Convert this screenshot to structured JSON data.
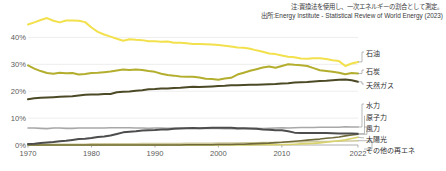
{
  "note": {
    "line1": "注:置換法を使用し、一次エネルギーの割合として測定。",
    "line2": "出所:Energy Institute - Statistical Review of World Energy (2023)"
  },
  "axis": {
    "y_ticks": [
      "0%",
      "10%",
      "20%",
      "30%",
      "40%"
    ],
    "x_ticks": [
      "1970",
      "1980",
      "1990",
      "2000",
      "2010",
      "2022"
    ]
  },
  "legend": {
    "oil": "石油",
    "coal": "石炭",
    "gas": "天然ガス",
    "hydro": "水力",
    "nuclear": "原子力",
    "wind": "風力",
    "solar": "太陽光",
    "other_renew": "その他の再エネ"
  },
  "colors": {
    "oil": "#f2e14d",
    "coal": "#b3ae2e",
    "gas": "#4c4a26",
    "hydro": "#a8a8a8",
    "nuclear": "#4d4d4d",
    "wind": "#6f6a3a",
    "solar": "#d8d26a",
    "other_renew": "#cfc9a0",
    "gridline": "#e6e6e6",
    "axis": "#9a9a9a",
    "leader": "#8c8c8c",
    "text": "#3b3b3b"
  },
  "chart_data": {
    "type": "line",
    "title": "",
    "xlabel": "",
    "ylabel": "",
    "xlim": [
      1970,
      2022
    ],
    "ylim": [
      0,
      45
    ],
    "grid": true,
    "legend_position": "right",
    "x": [
      1970,
      1971,
      1972,
      1973,
      1974,
      1975,
      1976,
      1977,
      1978,
      1979,
      1980,
      1981,
      1982,
      1983,
      1984,
      1985,
      1986,
      1987,
      1988,
      1989,
      1990,
      1991,
      1992,
      1993,
      1994,
      1995,
      1996,
      1997,
      1998,
      1999,
      2000,
      2001,
      2002,
      2003,
      2004,
      2005,
      2006,
      2007,
      2008,
      2009,
      2010,
      2011,
      2012,
      2013,
      2014,
      2015,
      2016,
      2017,
      2018,
      2019,
      2020,
      2021,
      2022
    ],
    "series": [
      {
        "name": "石油",
        "key": "oil",
        "color": "#f2e14d",
        "values": [
          44.8,
          45.6,
          46.5,
          47.2,
          46.2,
          45.6,
          46.3,
          46.3,
          46.2,
          45.7,
          43.7,
          42.1,
          41.1,
          40.3,
          39.5,
          38.8,
          39.3,
          39.1,
          39.0,
          38.6,
          38.6,
          38.4,
          38.5,
          38.0,
          38.0,
          37.8,
          37.6,
          37.6,
          37.5,
          37.4,
          37.2,
          36.9,
          36.6,
          36.3,
          36.2,
          35.8,
          35.2,
          34.7,
          34.0,
          33.8,
          33.3,
          32.8,
          32.6,
          32.2,
          32.1,
          32.3,
          32.3,
          32.0,
          31.5,
          31.2,
          29.4,
          30.3,
          30.9
        ]
      },
      {
        "name": "石炭",
        "key": "coal",
        "color": "#b3ae2e",
        "values": [
          29.6,
          28.4,
          27.5,
          26.8,
          26.5,
          26.9,
          26.7,
          26.8,
          26.2,
          26.4,
          26.8,
          26.9,
          27.1,
          27.3,
          27.7,
          28.1,
          27.9,
          28.1,
          27.9,
          27.5,
          27.2,
          26.5,
          26.0,
          25.8,
          25.5,
          25.4,
          25.4,
          25.1,
          24.6,
          24.5,
          24.3,
          24.7,
          25.0,
          26.2,
          26.9,
          27.6,
          28.2,
          28.8,
          29.2,
          28.7,
          29.4,
          30.0,
          29.8,
          29.7,
          29.4,
          28.6,
          27.8,
          27.5,
          27.2,
          26.9,
          26.3,
          26.8,
          26.6
        ]
      },
      {
        "name": "天然ガス",
        "key": "gas",
        "color": "#4c4a26",
        "values": [
          17.0,
          17.4,
          17.6,
          17.7,
          17.8,
          17.9,
          18.0,
          18.1,
          18.4,
          18.7,
          18.8,
          18.8,
          19.0,
          19.0,
          19.6,
          19.8,
          19.9,
          20.2,
          20.4,
          20.7,
          20.8,
          21.0,
          21.0,
          21.2,
          21.3,
          21.5,
          21.7,
          21.6,
          21.7,
          21.8,
          21.9,
          22.0,
          22.2,
          22.2,
          22.3,
          22.4,
          22.4,
          22.5,
          22.6,
          22.7,
          22.9,
          23.0,
          23.2,
          23.3,
          23.4,
          23.6,
          23.8,
          23.9,
          24.1,
          24.3,
          24.4,
          24.1,
          23.5
        ]
      },
      {
        "name": "水力",
        "key": "hydro",
        "color": "#a8a8a8",
        "values": [
          6.3,
          6.3,
          6.2,
          6.1,
          6.3,
          6.3,
          6.2,
          6.2,
          6.3,
          6.3,
          6.3,
          6.3,
          6.3,
          6.4,
          6.4,
          6.4,
          6.4,
          6.3,
          6.3,
          6.2,
          6.3,
          6.3,
          6.2,
          6.3,
          6.3,
          6.3,
          6.3,
          6.2,
          6.2,
          6.2,
          6.2,
          6.1,
          6.1,
          6.0,
          6.1,
          6.1,
          6.2,
          6.1,
          6.2,
          6.3,
          6.4,
          6.3,
          6.4,
          6.5,
          6.5,
          6.5,
          6.6,
          6.6,
          6.6,
          6.6,
          6.8,
          6.7,
          6.7
        ]
      },
      {
        "name": "原子力",
        "key": "nuclear",
        "color": "#4d4d4d",
        "values": [
          0.4,
          0.5,
          0.7,
          0.9,
          1.1,
          1.4,
          1.6,
          1.9,
          2.2,
          2.3,
          2.6,
          3.0,
          3.2,
          3.5,
          4.1,
          4.7,
          4.9,
          5.1,
          5.4,
          5.5,
          5.6,
          5.8,
          5.8,
          6.0,
          6.1,
          6.2,
          6.3,
          6.2,
          6.3,
          6.4,
          6.4,
          6.4,
          6.4,
          6.2,
          6.2,
          6.1,
          6.0,
          5.8,
          5.7,
          5.5,
          5.5,
          5.1,
          4.6,
          4.5,
          4.5,
          4.5,
          4.5,
          4.5,
          4.4,
          4.3,
          4.3,
          4.3,
          4.2
        ]
      },
      {
        "name": "風力",
        "key": "wind",
        "color": "#6f6a3a",
        "values": [
          0.0,
          0.0,
          0.0,
          0.0,
          0.0,
          0.0,
          0.0,
          0.0,
          0.0,
          0.0,
          0.0,
          0.0,
          0.0,
          0.0,
          0.0,
          0.0,
          0.0,
          0.0,
          0.0,
          0.0,
          0.0,
          0.0,
          0.0,
          0.0,
          0.0,
          0.1,
          0.1,
          0.1,
          0.1,
          0.1,
          0.2,
          0.2,
          0.2,
          0.3,
          0.3,
          0.4,
          0.5,
          0.6,
          0.7,
          0.9,
          1.0,
          1.2,
          1.4,
          1.6,
          1.8,
          2.0,
          2.2,
          2.5,
          2.7,
          3.0,
          3.4,
          3.7,
          4.0
        ]
      },
      {
        "name": "太陽光",
        "key": "solar",
        "color": "#d8d26a",
        "values": [
          0.0,
          0.0,
          0.0,
          0.0,
          0.0,
          0.0,
          0.0,
          0.0,
          0.0,
          0.0,
          0.0,
          0.0,
          0.0,
          0.0,
          0.0,
          0.0,
          0.0,
          0.0,
          0.0,
          0.0,
          0.0,
          0.0,
          0.0,
          0.0,
          0.0,
          0.0,
          0.0,
          0.0,
          0.0,
          0.0,
          0.0,
          0.0,
          0.0,
          0.0,
          0.0,
          0.0,
          0.1,
          0.1,
          0.1,
          0.1,
          0.2,
          0.2,
          0.3,
          0.4,
          0.5,
          0.6,
          0.8,
          1.0,
          1.3,
          1.6,
          1.9,
          2.4,
          2.9
        ]
      },
      {
        "name": "その他の再エネ",
        "key": "other_renew",
        "color": "#cfc9a0",
        "values": [
          0.3,
          0.3,
          0.3,
          0.3,
          0.3,
          0.3,
          0.3,
          0.3,
          0.3,
          0.3,
          0.4,
          0.4,
          0.4,
          0.4,
          0.4,
          0.4,
          0.4,
          0.4,
          0.5,
          0.5,
          0.5,
          0.5,
          0.5,
          0.5,
          0.5,
          0.6,
          0.6,
          0.6,
          0.6,
          0.6,
          0.7,
          0.7,
          0.7,
          0.7,
          0.8,
          0.8,
          0.8,
          0.9,
          0.9,
          0.9,
          1.0,
          1.0,
          1.1,
          1.1,
          1.2,
          1.2,
          1.3,
          1.3,
          1.4,
          1.4,
          1.5,
          1.5,
          1.6
        ]
      }
    ]
  }
}
